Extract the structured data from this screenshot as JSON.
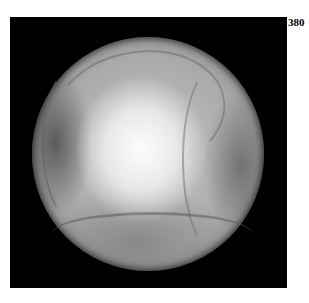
{
  "figure": {
    "panel_label": "380",
    "colors": {
      "background": "#ffffff",
      "frame": "#000000",
      "tissue_highlight": "#f5f5f5",
      "tissue_mid": "#a9a9a9"
    }
  }
}
